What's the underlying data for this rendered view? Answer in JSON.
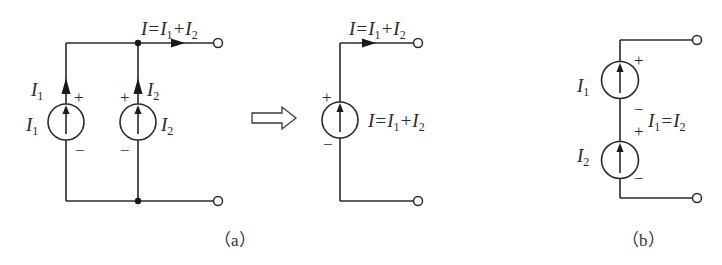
{
  "figure": {
    "panel_a": {
      "caption": "（a）",
      "output_current_label": {
        "main": "I=I",
        "sub1": "1",
        "plus": "+I",
        "sub2": "2"
      },
      "source1": {
        "name": "I",
        "sub": "1",
        "plus": "+",
        "minus": "−",
        "branch_name": "I",
        "branch_sub": "1"
      },
      "source2": {
        "name": "I",
        "sub": "2",
        "plus": "+",
        "minus": "−",
        "branch_name": "I",
        "branch_sub": "2"
      },
      "equivalent": {
        "top_label": {
          "main": "I=I",
          "sub1": "1",
          "plus": "+I",
          "sub2": "2"
        },
        "source_label": {
          "main": "I=I",
          "sub1": "1",
          "plus": "+I",
          "sub2": "2"
        },
        "plus": "+",
        "minus": "−"
      },
      "transform_arrow": "hollow-right-arrow"
    },
    "panel_b": {
      "caption": "（b）",
      "source1": {
        "name": "I",
        "sub": "1",
        "plus": "+",
        "minus": "−"
      },
      "source2": {
        "name": "I",
        "sub": "2",
        "plus": "+",
        "minus": "−"
      },
      "condition": {
        "a": "I",
        "sub1": "1",
        "eq": "=I",
        "sub2": "2"
      }
    },
    "colors": {
      "stroke": "#2a2a2a",
      "background": "#ffffff"
    }
  }
}
